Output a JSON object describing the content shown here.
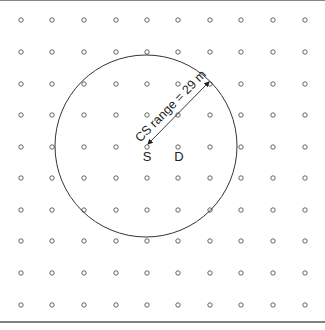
{
  "diagram": {
    "type": "grid-network",
    "grid": {
      "columns_x": [
        21,
        52,
        84,
        116,
        147,
        178,
        210,
        241,
        273,
        305
      ],
      "rows_y": [
        20,
        52,
        84,
        115,
        147,
        178,
        210,
        241,
        273,
        305
      ],
      "node_radius": 2.2
    },
    "range_circle": {
      "cx": 146,
      "cy": 146,
      "r": 91,
      "color": "#333333"
    },
    "source": {
      "label": "S",
      "x": 146,
      "y": 147
    },
    "destination": {
      "label": "D",
      "x": 178,
      "y": 147
    },
    "range_arrow": {
      "x1": 148,
      "y1": 144,
      "x2": 209,
      "y2": 82
    },
    "range_label": "CS range = 29 m",
    "frame": {
      "top_y": 0.5,
      "bottom_y": 322,
      "color": "#555555"
    }
  }
}
